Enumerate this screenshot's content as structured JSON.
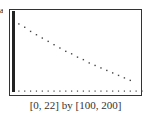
{
  "figure_label": "a",
  "caption": "[0, 22] by [100, 200]",
  "chart_data": {
    "type": "scatter",
    "title": "",
    "xlabel": "",
    "ylabel": "",
    "xlim": [
      0,
      22
    ],
    "ylim": [
      100,
      200
    ],
    "grid": false,
    "x": [
      1,
      2,
      3,
      4,
      5,
      6,
      7,
      8,
      9,
      10,
      11,
      12,
      13,
      14,
      15,
      16,
      17,
      18,
      19,
      20
    ],
    "y": [
      182,
      178,
      173,
      169,
      165,
      161,
      157,
      153,
      149,
      146,
      142,
      139,
      135,
      132,
      129,
      126,
      123,
      120,
      117,
      114
    ],
    "annotations": [
      "[0, 22] by [100, 200]"
    ]
  },
  "colors": {
    "points": "#444444",
    "frame": "#333333",
    "axis": "#222222"
  }
}
